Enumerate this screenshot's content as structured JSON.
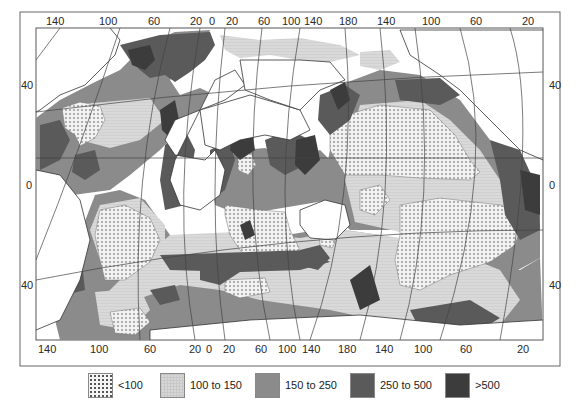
{
  "figure": {
    "type": "world-ocean-productivity-map",
    "top_longitude_labels": [
      "140",
      "100",
      "60",
      "20",
      "0",
      "20",
      "60",
      "100",
      "140",
      "180",
      "140",
      "100",
      "60",
      "20"
    ],
    "bottom_longitude_labels": [
      "140",
      "100",
      "60",
      "20",
      "0",
      "20",
      "60",
      "100",
      "140",
      "180",
      "140",
      "100",
      "60",
      "20"
    ],
    "left_latitude_labels": [
      "40",
      "0",
      "40"
    ],
    "right_latitude_labels": [
      "40",
      "0",
      "40"
    ]
  },
  "legend": {
    "items": [
      {
        "key": "lt100",
        "label": "<100",
        "color": "#f4f4f4",
        "pattern": "dotted"
      },
      {
        "key": "100-150",
        "label": "100 to 150",
        "color": "#d7d7d7",
        "pattern": "light-grid"
      },
      {
        "key": "150-250",
        "label": "150 to 250",
        "color": "#8b8b8b",
        "pattern": "solid"
      },
      {
        "key": "250-500",
        "label": "250 to 500",
        "color": "#5a5a5a",
        "pattern": "solid"
      },
      {
        "key": "gt500",
        "label": ">500",
        "color": "#3c3c3c",
        "pattern": "solid"
      }
    ]
  },
  "colors": {
    "land": "#ffffff",
    "frame": "#555555",
    "graticule": "#444444"
  }
}
